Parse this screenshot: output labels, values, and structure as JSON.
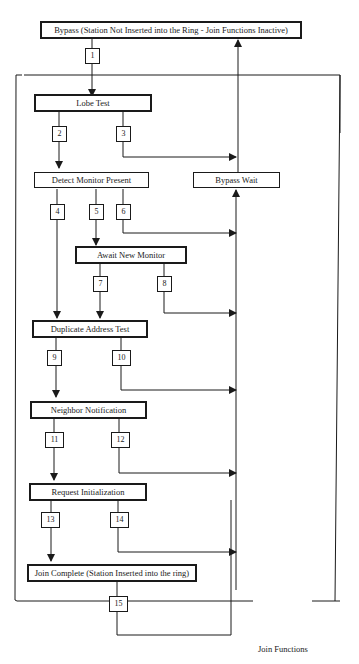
{
  "diagram": {
    "title": "Join Functions",
    "frame_label": "Join Functions",
    "states": [
      {
        "id": "bypass",
        "label": "Bypass (Station Not Inserted into the Ring - Join Functions Inactive)"
      },
      {
        "id": "lobe_test",
        "label": "Lobe Test"
      },
      {
        "id": "detect_monitor_present",
        "label": "Detect Monitor Present"
      },
      {
        "id": "bypass_wait",
        "label": "Bypass Wait"
      },
      {
        "id": "await_new_monitor",
        "label": "Await New Monitor"
      },
      {
        "id": "duplicate_address_test",
        "label": "Duplicate Address Test"
      },
      {
        "id": "neighbor_notification",
        "label": "Neighbor Notification"
      },
      {
        "id": "request_initialization",
        "label": "Request Initialization"
      },
      {
        "id": "join_complete",
        "label": "Join Complete (Station Inserted into the ring)"
      }
    ],
    "transitions": [
      {
        "label": "1",
        "from": "bypass",
        "to": "lobe_test"
      },
      {
        "label": "2",
        "from": "lobe_test",
        "to": "detect_monitor_present"
      },
      {
        "label": "3",
        "from": "lobe_test",
        "to": "bypass_wait"
      },
      {
        "label": "4",
        "from": "detect_monitor_present",
        "to": "duplicate_address_test"
      },
      {
        "label": "5",
        "from": "detect_monitor_present",
        "to": "await_new_monitor"
      },
      {
        "label": "6",
        "from": "detect_monitor_present",
        "to": "bypass_wait"
      },
      {
        "label": "7",
        "from": "await_new_monitor",
        "to": "duplicate_address_test"
      },
      {
        "label": "8",
        "from": "await_new_monitor",
        "to": "bypass_wait"
      },
      {
        "label": "9",
        "from": "duplicate_address_test",
        "to": "neighbor_notification"
      },
      {
        "label": "10",
        "from": "duplicate_address_test",
        "to": "bypass_wait"
      },
      {
        "label": "11",
        "from": "neighbor_notification",
        "to": "request_initialization"
      },
      {
        "label": "12",
        "from": "neighbor_notification",
        "to": "bypass_wait"
      },
      {
        "label": "13",
        "from": "request_initialization",
        "to": "join_complete"
      },
      {
        "label": "14",
        "from": "request_initialization",
        "to": "bypass_wait"
      },
      {
        "label": "15",
        "from": "join_complete",
        "to": "bypass_wait"
      },
      {
        "label": "",
        "from": "bypass_wait",
        "to": "bypass"
      }
    ]
  }
}
